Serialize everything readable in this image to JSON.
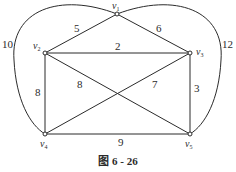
{
  "caption": "图 6 - 26",
  "nodes": [
    {
      "id": "top",
      "label": "v",
      "sub": "1",
      "x": 117,
      "y": 14
    },
    {
      "id": "left",
      "label": "v",
      "sub": "2",
      "x": 45,
      "y": 53
    },
    {
      "id": "right",
      "label": "v",
      "sub": "3",
      "x": 190,
      "y": 53
    },
    {
      "id": "bottom_left",
      "label": "v",
      "sub": "4",
      "x": 45,
      "y": 134
    },
    {
      "id": "bottom_right",
      "label": "v",
      "sub": "5",
      "x": 190,
      "y": 134
    }
  ],
  "edges": [
    {
      "from": "top",
      "to": "left",
      "weight": "5"
    },
    {
      "from": "top",
      "to": "right",
      "weight": "6"
    },
    {
      "from": "left",
      "to": "right",
      "weight": "2"
    },
    {
      "from": "left",
      "to": "bottom_left",
      "weight": "8"
    },
    {
      "from": "left",
      "to": "bottom_right",
      "weight": "8"
    },
    {
      "from": "right",
      "to": "bottom_left",
      "weight": "7"
    },
    {
      "from": "right",
      "to": "bottom_right",
      "weight": "3"
    },
    {
      "from": "bottom_left",
      "to": "bottom_right",
      "weight": "9"
    },
    {
      "from": "top",
      "to": "bottom_left",
      "weight": "10",
      "curved": true
    },
    {
      "from": "top",
      "to": "bottom_right",
      "weight": "12",
      "curved": true
    }
  ],
  "weights": {
    "top_left": "5",
    "top_right": "6",
    "left_right": "2",
    "left_bl": "8",
    "left_br": "8",
    "right_bl": "7",
    "right_br": "3",
    "bl_br": "9",
    "curve_left": "10",
    "curve_right": "12"
  },
  "vertex_labels": {
    "top": {
      "main": "v",
      "sub": "1"
    },
    "left": {
      "main": "v",
      "sub": "2"
    },
    "right": {
      "main": "v",
      "sub": "3"
    },
    "bottom_left": {
      "main": "v",
      "sub": "4"
    },
    "bottom_right": {
      "main": "v",
      "sub": "5"
    }
  }
}
